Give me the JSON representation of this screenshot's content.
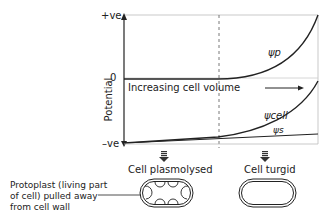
{
  "diagram": {
    "y_axis_label": "Potential",
    "y_ticks": {
      "top": "+ve",
      "zero": "0",
      "bottom": "–ve"
    },
    "x_arrow_label": "Increasing cell volume",
    "curves": {
      "pressure": "ψp",
      "cell": "ψcell",
      "solute": "ψs"
    },
    "states": {
      "left": "Cell plasmolysed",
      "right": "Cell turgid"
    },
    "annotation": "Protoplast (living part of cell) pulled away from cell wall",
    "annotation_lines": [
      "Protoplast (living part",
      "of cell) pulled away",
      "from cell wall"
    ]
  }
}
